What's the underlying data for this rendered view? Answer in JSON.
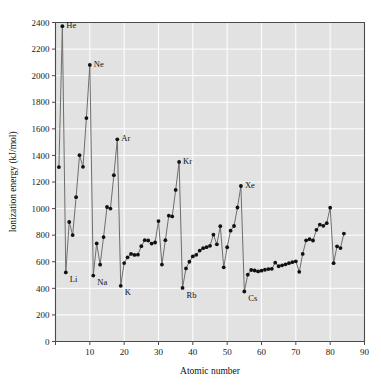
{
  "chart_data": {
    "type": "line",
    "title": "",
    "subtitle": "",
    "xlabel": "Atomic number",
    "ylabel": "Ionization energy (kJ/mol)",
    "xlim": [
      0,
      90
    ],
    "ylim": [
      0,
      2400
    ],
    "xticks": [
      0,
      10,
      20,
      30,
      40,
      50,
      60,
      70,
      80,
      90
    ],
    "xtick_labels": [
      "0",
      "10",
      "20",
      "30",
      "40",
      "50",
      "60",
      "70",
      "80",
      "90"
    ],
    "yticks": [
      0,
      200,
      400,
      600,
      800,
      1000,
      1200,
      1400,
      1600,
      1800,
      2000,
      2200,
      2400
    ],
    "ytick_labels": [
      "0",
      "200",
      "400",
      "600",
      "800",
      "1000",
      "1200",
      "1400",
      "1600",
      "1800",
      "2000",
      "2200",
      "2400"
    ],
    "grid": true,
    "legend": "none",
    "plot_bg_color": "#e2e2e2",
    "grid_color": "#ffffff",
    "line_color": "#6e6e6e",
    "marker_color": "#111111",
    "x": [
      1,
      2,
      3,
      4,
      5,
      6,
      7,
      8,
      9,
      10,
      11,
      12,
      13,
      14,
      15,
      16,
      17,
      18,
      19,
      20,
      21,
      22,
      23,
      24,
      25,
      26,
      27,
      28,
      29,
      30,
      31,
      32,
      33,
      34,
      35,
      36,
      37,
      38,
      39,
      40,
      41,
      42,
      43,
      44,
      45,
      46,
      47,
      48,
      49,
      50,
      51,
      52,
      53,
      54,
      55,
      56,
      57,
      58,
      59,
      60,
      61,
      62,
      63,
      64,
      65,
      66,
      67,
      68,
      69,
      70,
      71,
      72,
      73,
      74,
      75,
      76,
      77,
      78,
      79,
      80,
      81,
      82,
      83,
      84
    ],
    "values": [
      1312,
      2372,
      520,
      899,
      801,
      1086,
      1402,
      1314,
      1681,
      2081,
      496,
      738,
      578,
      786,
      1012,
      1000,
      1251,
      1521,
      419,
      590,
      633,
      659,
      651,
      653,
      717,
      762,
      760,
      737,
      745,
      906,
      579,
      762,
      947,
      941,
      1140,
      1351,
      403,
      550,
      600,
      640,
      652,
      684,
      702,
      710,
      720,
      804,
      731,
      868,
      558,
      709,
      834,
      869,
      1008,
      1170,
      376,
      503,
      538,
      534,
      527,
      533,
      540,
      545,
      547,
      593,
      566,
      573,
      581,
      589,
      597,
      603,
      524,
      659,
      761,
      770,
      760,
      840,
      880,
      870,
      890,
      1007,
      589,
      716,
      703,
      812
    ],
    "series_name": "First ionization energy",
    "annotations": [
      {
        "label": "He",
        "x": 2,
        "y": 2372,
        "dx": 4,
        "dy": -1
      },
      {
        "label": "Ne",
        "x": 10,
        "y": 2081,
        "dx": 4,
        "dy": -1
      },
      {
        "label": "Ar",
        "x": 18,
        "y": 1521,
        "dx": 4,
        "dy": -1
      },
      {
        "label": "Kr",
        "x": 36,
        "y": 1351,
        "dx": 4,
        "dy": -1
      },
      {
        "label": "Xe",
        "x": 54,
        "y": 1170,
        "dx": 4,
        "dy": -1
      },
      {
        "label": "Li",
        "x": 3,
        "y": 520,
        "dx": 4,
        "dy": 7
      },
      {
        "label": "Na",
        "x": 11,
        "y": 496,
        "dx": 4,
        "dy": 7
      },
      {
        "label": "K",
        "x": 19,
        "y": 419,
        "dx": 4,
        "dy": 7
      },
      {
        "label": "Rb",
        "x": 37,
        "y": 403,
        "dx": 4,
        "dy": 7
      },
      {
        "label": "Cs",
        "x": 55,
        "y": 376,
        "dx": 4,
        "dy": 7
      }
    ]
  }
}
